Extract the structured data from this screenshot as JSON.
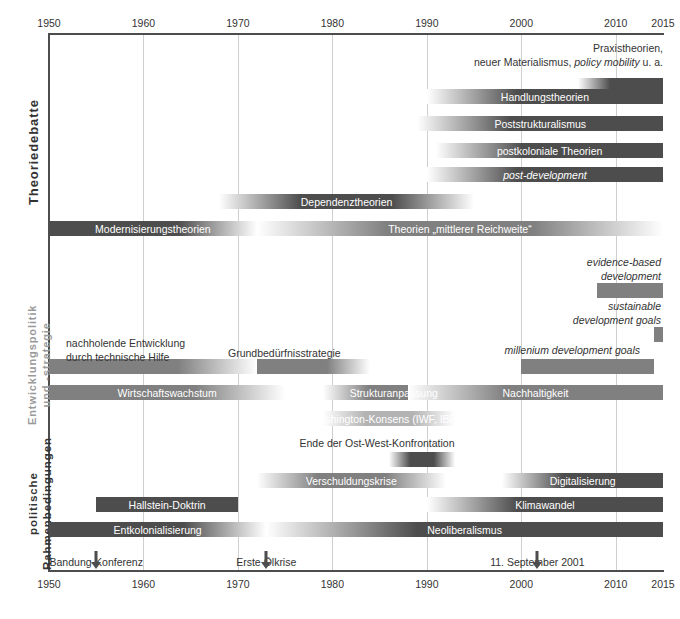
{
  "chart_data": {
    "type": "bar",
    "title": "",
    "subtitle": "",
    "xlabel": "",
    "ylabel": "",
    "xlim": [
      1950,
      2015
    ],
    "grid": true,
    "legend_position": "none",
    "orientation": "horizontal-timeline",
    "axis": {
      "ticks": [
        1950,
        1960,
        1970,
        1980,
        1990,
        2000,
        2010,
        2015
      ],
      "tick_labels": [
        "1950",
        "1960",
        "1970",
        "1980",
        "1990",
        "2000",
        "2010",
        "2015"
      ],
      "top_axis": true,
      "bottom_axis": true
    },
    "groups": [
      {
        "id": "theoriedebatte",
        "label": "Theoriedebatte",
        "label_color": "#333333",
        "bars": [
          {
            "label": "Praxistheorien, neuer Materialismus, policy mobility u. a.",
            "bar_label": "",
            "start": 2006,
            "end": 2015,
            "fade_in": true,
            "fade_out": false,
            "color": "#4d4d4d",
            "annotation_lines": [
              "Praxistheorien,",
              "neuer Materialismus, policy mobility u. a."
            ],
            "annotation_italic_part": "policy mobility"
          },
          {
            "label": "Handlungstheorien",
            "bar_label": "Handlungstheorien",
            "start": 1990,
            "end": 2015,
            "fade_in": true,
            "fade_out": false,
            "color": "#4d4d4d"
          },
          {
            "label": "Poststrukturalismus",
            "bar_label": "Poststrukturalismus",
            "start": 1989,
            "end": 2015,
            "fade_in": true,
            "fade_out": false,
            "color": "#4d4d4d"
          },
          {
            "label": "postkoloniale Theorien",
            "bar_label": "postkoloniale Theorien",
            "start": 1991,
            "end": 2015,
            "fade_in": true,
            "fade_out": false,
            "color": "#4d4d4d"
          },
          {
            "label": "post-development",
            "bar_label": "post-development",
            "start": 1990,
            "end": 2015,
            "fade_in": true,
            "fade_out": false,
            "color": "#4d4d4d",
            "italic": true
          },
          {
            "label": "Dependenztheorien",
            "bar_label": "Dependenztheorien",
            "start": 1968,
            "end": 1995,
            "fade_in": true,
            "fade_out": true,
            "color": "#4d4d4d"
          },
          {
            "label": "Modernisierungstheorien",
            "bar_label": "Modernisierungstheorien",
            "start": 1950,
            "end": 1972,
            "fade_in": false,
            "fade_out": true,
            "color": "#4d4d4d"
          },
          {
            "label": "Theorien „mittlerer Reichweite“",
            "bar_label": "Theorien „mittlerer Reichweite“",
            "start": 1972,
            "end": 2015,
            "fade_in": true,
            "fade_out": true,
            "color": "#808080"
          }
        ]
      },
      {
        "id": "entwicklungspolitik",
        "label": "Entwicklungspolitik und -strategie",
        "label_color": "#9a9a9a",
        "bars": [
          {
            "label": "evidence-based development",
            "bar_label": "",
            "start": 2008,
            "end": 2015,
            "fade_in": false,
            "fade_out": false,
            "color": "#808080",
            "annotation_lines": [
              "evidence-based",
              "development"
            ],
            "italic": true
          },
          {
            "label": "sustainable development goals",
            "bar_label": "",
            "start": 2014,
            "end": 2015,
            "fade_in": false,
            "fade_out": false,
            "color": "#808080",
            "annotation_lines": [
              "sustainable",
              "development goals"
            ],
            "italic": true
          },
          {
            "label": "millenium development goals",
            "bar_label": "",
            "start": 2000,
            "end": 2014,
            "fade_in": false,
            "fade_out": false,
            "color": "#808080",
            "annotation_lines": [
              "millenium development goals"
            ],
            "italic": true
          },
          {
            "label": "nachholende Entwicklung durch technische Hilfe",
            "bar_label": "",
            "start": 1950,
            "end": 1972,
            "fade_in": false,
            "fade_out": true,
            "color": "#808080",
            "annotation_lines": [
              "nachholende Entwicklung",
              "durch technische Hilfe"
            ]
          },
          {
            "label": "Grundbedürfnisstrategie",
            "bar_label": "",
            "start": 1972,
            "end": 1984,
            "fade_in": false,
            "fade_out": true,
            "color": "#808080",
            "annotation_lines": [
              "Grundbedürfnisstrategie"
            ]
          },
          {
            "label": "Wirtschaftswachstum",
            "bar_label": "Wirtschaftswachstum",
            "start": 1950,
            "end": 1975,
            "fade_in": false,
            "fade_out": true,
            "color": "#808080"
          },
          {
            "label": "Strukturanpassung",
            "bar_label": "Strukturanpassung",
            "start": 1979,
            "end": 1994,
            "fade_in": true,
            "fade_out": true,
            "color": "#808080"
          },
          {
            "label": "Nachhaltigkeit",
            "bar_label": "Nachhaltigkeit",
            "start": 1988,
            "end": 2015,
            "fade_in": true,
            "fade_out": false,
            "color": "#808080"
          },
          {
            "label": "Washington-Konsens (IWF, IBRD)",
            "bar_label": "Washington-Konsens (IWF, IBRD)",
            "start": 1979,
            "end": 1993,
            "fade_in": true,
            "fade_out": true,
            "color": "#b3b3b3"
          }
        ]
      },
      {
        "id": "rahmenbedingungen",
        "label": "politische Rahmenbedingungen",
        "label_color": "#333333",
        "bars": [
          {
            "label": "Ende der Ost-West-Konfrontation",
            "bar_label": "",
            "start": 1986,
            "end": 1993,
            "fade_in": true,
            "fade_out": true,
            "color": "#4d4d4d",
            "annotation_lines": [
              "Ende der Ost-West-Konfrontation"
            ]
          },
          {
            "label": "Verschuldungskrise",
            "bar_label": "Verschuldungskrise",
            "start": 1972,
            "end": 1992,
            "fade_in": true,
            "fade_out": true,
            "color": "#808080"
          },
          {
            "label": "Digitalisierung",
            "bar_label": "Digitalisierung",
            "start": 1998,
            "end": 2015,
            "fade_in": true,
            "fade_out": false,
            "color": "#4d4d4d"
          },
          {
            "label": "Hallstein-Doktrin",
            "bar_label": "Hallstein-Doktrin",
            "start": 1955,
            "end": 1970,
            "fade_in": false,
            "fade_out": false,
            "color": "#4d4d4d"
          },
          {
            "label": "Klimawandel",
            "bar_label": "Klimawandel",
            "start": 1990,
            "end": 2015,
            "fade_in": true,
            "fade_out": false,
            "color": "#4d4d4d"
          },
          {
            "label": "Entkolonialisierung",
            "bar_label": "Entkolonialisierung",
            "start": 1950,
            "end": 1973,
            "fade_in": false,
            "fade_out": true,
            "color": "#4d4d4d"
          },
          {
            "label": "Neoliberalismus",
            "bar_label": "Neoliberalismus",
            "start": 1973,
            "end": 2015,
            "fade_in": true,
            "fade_out": false,
            "color": "#4d4d4d"
          }
        ]
      }
    ],
    "events": [
      {
        "label": "Bandung-Konferenz",
        "year": 1955
      },
      {
        "label": "Erste Ölkrise",
        "year": 1973
      },
      {
        "label": "11. September 2001",
        "year": 2001.7
      }
    ],
    "colors": {
      "dark_bar": "#4d4d4d",
      "mid_bar": "#808080",
      "light_bar": "#b3b3b3",
      "grid": "#cfcfcf",
      "axis": "#4d4d4d",
      "text": "#333333",
      "muted_text": "#9a9a9a",
      "bar_text": "#ffffff",
      "background": "#ffffff"
    }
  }
}
